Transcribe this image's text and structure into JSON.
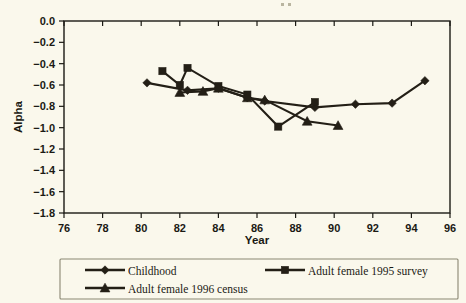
{
  "figure": {
    "background_color": "#faf8ec",
    "ink_color": "#231f16",
    "axis_color": "#1b1a14",
    "legend_border_color": "#8a8773"
  },
  "axis_titles": {
    "x": "Year",
    "y": "Alpha"
  },
  "x_ticks": [
    "76",
    "78",
    "80",
    "82",
    "84",
    "86",
    "88",
    "90",
    "92",
    "94",
    "96"
  ],
  "y_ticks": [
    "0.0",
    "−0.2",
    "−0.4",
    "−0.6",
    "−0.8",
    "−1.0",
    "−1.2",
    "−1.4",
    "−1.6",
    "−1.8"
  ],
  "legend": {
    "entries": [
      {
        "label": "Childhood",
        "marker": "diamond"
      },
      {
        "label": "Adult female 1995 survey",
        "marker": "square"
      },
      {
        "label": "Adult female 1996 census",
        "marker": "triangle"
      }
    ]
  },
  "chart_data": {
    "type": "line",
    "title": "",
    "subtitle": "",
    "xlabel": "Year",
    "ylabel": "Alpha",
    "xlim": [
      76,
      96
    ],
    "ylim": [
      -1.8,
      0.0
    ],
    "x_tick_values": [
      76,
      78,
      80,
      82,
      84,
      86,
      88,
      90,
      92,
      94,
      96
    ],
    "y_tick_values": [
      0.0,
      -0.2,
      -0.4,
      -0.6,
      -0.8,
      -1.0,
      -1.2,
      -1.4,
      -1.6,
      -1.8
    ],
    "grid": false,
    "legend_position": "bottom",
    "series": [
      {
        "name": "Childhood",
        "marker": "diamond",
        "x": [
          80.3,
          82.4,
          84.0,
          85.5,
          86.4,
          89.0,
          91.1,
          93.0,
          94.7
        ],
        "y": [
          -0.58,
          -0.65,
          -0.63,
          -0.72,
          -0.75,
          -0.81,
          -0.78,
          -0.77,
          -0.56
        ]
      },
      {
        "name": "Adult female 1995 survey",
        "marker": "square",
        "x": [
          81.1,
          82.0,
          82.4,
          84.0,
          85.5,
          87.1,
          89.0
        ],
        "y": [
          -0.47,
          -0.6,
          -0.44,
          -0.61,
          -0.69,
          -0.99,
          -0.76
        ]
      },
      {
        "name": "Adult female 1996 census",
        "marker": "triangle",
        "x": [
          82.0,
          83.2,
          84.0,
          85.5,
          86.4,
          88.6,
          90.2
        ],
        "y": [
          -0.67,
          -0.66,
          -0.63,
          -0.72,
          -0.74,
          -0.94,
          -0.98
        ]
      }
    ]
  }
}
